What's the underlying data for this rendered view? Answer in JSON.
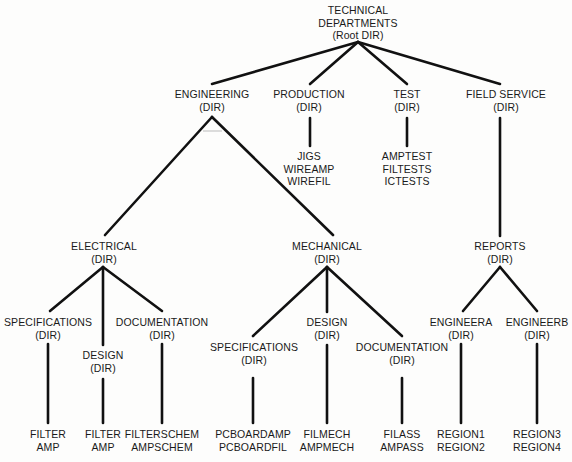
{
  "line_color": "#111111",
  "nodes": {
    "root": {
      "line1": "TECHNICAL",
      "line2": "DEPARTMENTS",
      "line3": "(Root DIR)"
    },
    "engineering": {
      "name": "ENGINEERING",
      "type": "(DIR)"
    },
    "production": {
      "name": "PRODUCTION",
      "type": "(DIR)",
      "files": [
        "JIGS",
        "WIREAMP",
        "WIREFIL"
      ]
    },
    "test": {
      "name": "TEST",
      "type": "(DIR)",
      "files": [
        "AMPTEST",
        "FILTESTS",
        "ICTESTS"
      ]
    },
    "field_service": {
      "name": "FIELD SERVICE",
      "type": "(DIR)"
    },
    "electrical": {
      "name": "ELECTRICAL",
      "type": "(DIR)"
    },
    "mechanical": {
      "name": "MECHANICAL",
      "type": "(DIR)"
    },
    "reports": {
      "name": "REPORTS",
      "type": "(DIR)"
    },
    "elec_specifications": {
      "name": "SPECIFICATIONS",
      "type": "(DIR)",
      "files": [
        "FILTER",
        "AMP"
      ]
    },
    "elec_design": {
      "name": "DESIGN",
      "type": "(DIR)",
      "files": [
        "FILTER",
        "AMP"
      ]
    },
    "elec_documentation": {
      "name": "DOCUMENTATION",
      "type": "(DIR)",
      "files": [
        "FILTERSCHEM",
        "AMPSCHEM"
      ]
    },
    "mech_specifications": {
      "name": "SPECIFICATIONS",
      "type": "(DIR)",
      "files": [
        "PCBOARDAMP",
        "PCBOARDFIL"
      ]
    },
    "mech_design": {
      "name": "DESIGN",
      "type": "(DIR)",
      "files": [
        "FILMECH",
        "AMPMECH"
      ]
    },
    "mech_documentation": {
      "name": "DOCUMENTATION",
      "type": "(DIR)",
      "files": [
        "FILASS",
        "AMPASS"
      ]
    },
    "engineera": {
      "name": "ENGINEERA",
      "type": "(DIR)",
      "files": [
        "REGION1",
        "REGION2"
      ]
    },
    "engineerb": {
      "name": "ENGINEERB",
      "type": "(DIR)",
      "files": [
        "REGION3",
        "REGION4"
      ]
    }
  }
}
